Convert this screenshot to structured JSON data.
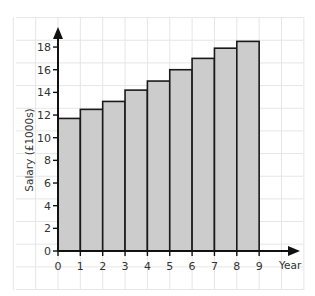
{
  "chart_data": {
    "type": "bar",
    "title": "",
    "xlabel": "Year",
    "ylabel": "Salary (£1000s)",
    "categories": [
      "1",
      "2",
      "3",
      "4",
      "5",
      "6",
      "7",
      "8",
      "9"
    ],
    "bar_intervals": [
      [
        0,
        1
      ],
      [
        1,
        2
      ],
      [
        2,
        3
      ],
      [
        3,
        4
      ],
      [
        4,
        5
      ],
      [
        5,
        6
      ],
      [
        6,
        7
      ],
      [
        7,
        8
      ],
      [
        8,
        9
      ]
    ],
    "values": [
      11.7,
      12.5,
      13.2,
      14.2,
      15.0,
      16.0,
      17.0,
      17.9,
      18.5
    ],
    "x_ticks": [
      "0",
      "1",
      "2",
      "3",
      "4",
      "5",
      "6",
      "7",
      "8",
      "9"
    ],
    "y_ticks": [
      "0",
      "2",
      "4",
      "6",
      "8",
      "10",
      "12",
      "14",
      "16",
      "18"
    ],
    "xlim": [
      0,
      10.5
    ],
    "ylim": [
      0,
      20
    ],
    "grid": true,
    "legend": null,
    "colors": {
      "bar_fill": "#cccccc",
      "bar_stroke": "#1a1a1a",
      "grid": "#e6e6e6",
      "axis": "#111111"
    }
  }
}
